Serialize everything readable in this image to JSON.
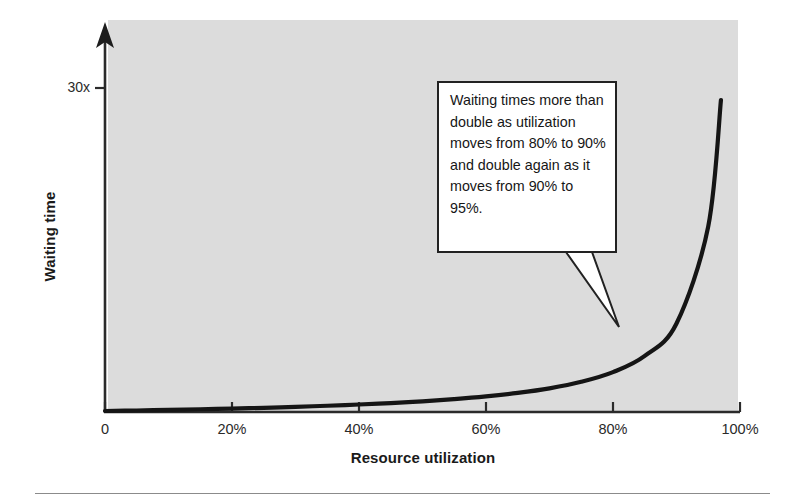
{
  "chart_data": {
    "type": "line",
    "title": "",
    "subtitle": "",
    "xlabel": "Resource utilization",
    "ylabel": "Waiting time",
    "xlim": [
      0,
      100
    ],
    "ylim": [
      0,
      40
    ],
    "grid": false,
    "legend": null,
    "x_ticks": [
      "0",
      "20%",
      "40%",
      "60%",
      "80%",
      "100%"
    ],
    "x_tick_values": [
      0,
      20,
      40,
      60,
      80,
      100
    ],
    "y_ticks": [
      "30x"
    ],
    "y_tick_values": [
      30
    ],
    "series": [
      {
        "name": "Waiting time vs utilization",
        "note": "M/M/1 queueing curve, waiting time proportional to rho/(1-rho)",
        "x": [
          0,
          5,
          10,
          15,
          20,
          25,
          30,
          35,
          40,
          45,
          50,
          55,
          60,
          65,
          70,
          75,
          80,
          85,
          90,
          95,
          97
        ],
        "values": [
          0,
          0.05,
          0.11,
          0.18,
          0.25,
          0.33,
          0.43,
          0.54,
          0.67,
          0.82,
          1.0,
          1.22,
          1.5,
          1.86,
          2.33,
          3.0,
          4.0,
          5.67,
          9.0,
          19.0,
          32.0
        ]
      }
    ],
    "annotations": [
      {
        "name": "utilization-callout",
        "text": "Waiting times more than double as utilization moves from 80% to 90% and double again as it moves from 90% to 95%.",
        "points_to_x": 82,
        "points_to_y": 4.4
      }
    ],
    "colors": {
      "plot_background": "#dcdcdc",
      "curve": "#1a1a1a",
      "axis": "#2b2b2b",
      "callout_background": "#ffffff",
      "callout_border": "#222222",
      "page_background": "#ffffff"
    }
  },
  "axis": {
    "y_label": "Waiting time",
    "y_tick_30x": "30x",
    "x_label": "Resource utilization",
    "x_ticks": [
      {
        "label": "0",
        "x": 105
      },
      {
        "label": "20%",
        "x": 232
      },
      {
        "label": "40%",
        "x": 359
      },
      {
        "label": "60%",
        "x": 486
      },
      {
        "label": "80%",
        "x": 613
      },
      {
        "label": "100%",
        "x": 740
      }
    ]
  },
  "callout": {
    "text": "Waiting times more than double as utilization moves from 80% to 90% and double again as it moves from 90% to 95%."
  }
}
